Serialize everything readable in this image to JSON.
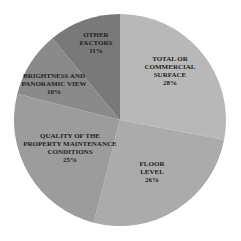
{
  "chart_data": {
    "type": "pie",
    "title": "",
    "center": [
      120,
      120
    ],
    "radius": 106,
    "start_angle_deg": 0,
    "direction": "clockwise",
    "slices": [
      {
        "label": "TOTAL OR COMMERCIAL SURFACE",
        "lines": [
          "TOTAL OR",
          "COMMERCIAL",
          "SURFACE",
          "28%"
        ],
        "value": 28,
        "color": "#b8b8b8",
        "lx": 170,
        "ly": 70
      },
      {
        "label": "FLOOR LEVEL",
        "lines": [
          "FLOOR",
          "LEVEL",
          "26%"
        ],
        "value": 26,
        "color": "#ababab",
        "lx": 152,
        "ly": 171
      },
      {
        "label": "QUALITY OF THE PROPERTY MAINTENANCE CONDITIONS",
        "lines": [
          "QUALITY OF THE",
          "PROPERTY MAINTENANCE",
          "CONDITIONS",
          "25%"
        ],
        "value": 25,
        "color": "#9c9c9c",
        "lx": 70,
        "ly": 147
      },
      {
        "label": "BRIGHTNESS AND PANORAMIC VIEW",
        "lines": [
          "BRIGHTNESS AND",
          "PANORAMIC VIEW",
          "10%"
        ],
        "value": 10,
        "color": "#8a8a8a",
        "lx": 54,
        "ly": 83
      },
      {
        "label": "OTHER FACTORS",
        "lines": [
          "OTHER",
          "FACTORS",
          "11%"
        ],
        "value": 11,
        "color": "#797979",
        "lx": 96,
        "ly": 42
      }
    ]
  }
}
